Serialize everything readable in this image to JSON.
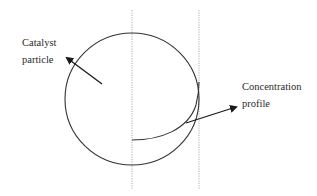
{
  "diagram": {
    "labels": {
      "catalyst": {
        "line1": "Catalyst",
        "line2": "particle"
      },
      "concentration": {
        "line1": "Concentration",
        "line2": "profile"
      }
    },
    "colors": {
      "stroke": "#333333",
      "dotted": "#9a9a9a",
      "text": "#2a2a2a",
      "background": "#ffffff"
    },
    "elements": [
      "catalyst-particle-circle",
      "center-dotted-line",
      "surface-dotted-line",
      "concentration-profile-curve",
      "catalyst-arrow",
      "concentration-arrow"
    ]
  }
}
